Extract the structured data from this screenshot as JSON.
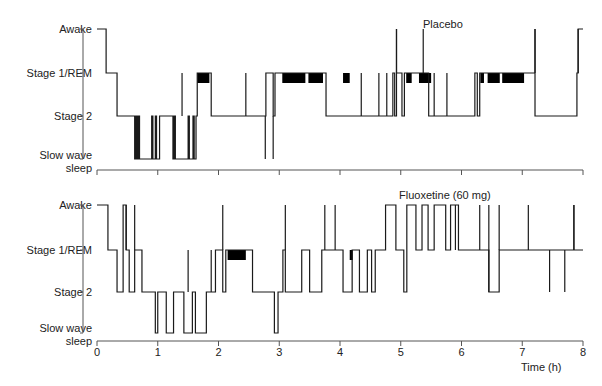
{
  "chart_data": [
    {
      "type": "line",
      "subtype": "hypnogram-step",
      "title": "Placebo",
      "xlabel": "Time (h)",
      "ylabel": "",
      "y_categories": [
        "Slow wave sleep",
        "Stage 2",
        "Stage 1/REM",
        "Awake"
      ],
      "xlim": [
        0,
        8
      ],
      "grid": false,
      "steps": [
        [
          0.0,
          3
        ],
        [
          0.15,
          2
        ],
        [
          0.33,
          1
        ],
        [
          0.62,
          0
        ],
        [
          0.64,
          1
        ],
        [
          0.66,
          0
        ],
        [
          0.68,
          1
        ],
        [
          0.7,
          0
        ],
        [
          0.9,
          1
        ],
        [
          0.92,
          0
        ],
        [
          0.96,
          1
        ],
        [
          0.98,
          0
        ],
        [
          1.03,
          1
        ],
        [
          1.23,
          1
        ],
        [
          1.25,
          0
        ],
        [
          1.27,
          1
        ],
        [
          1.29,
          0
        ],
        [
          1.5,
          1
        ],
        [
          1.52,
          0
        ],
        [
          1.58,
          1
        ],
        [
          1.6,
          0
        ],
        [
          1.63,
          1
        ],
        [
          1.65,
          2
        ],
        [
          1.88,
          1
        ],
        [
          2.77,
          0
        ],
        [
          2.77,
          1
        ],
        [
          2.78,
          2
        ],
        [
          2.9,
          1
        ],
        [
          2.93,
          2
        ],
        [
          3.77,
          1
        ],
        [
          4.87,
          2
        ],
        [
          4.9,
          1
        ],
        [
          4.93,
          3
        ],
        [
          4.93,
          2
        ],
        [
          5.02,
          1
        ],
        [
          5.06,
          2
        ],
        [
          5.46,
          1
        ],
        [
          5.55,
          2
        ],
        [
          5.55,
          1
        ],
        [
          5.76,
          2
        ],
        [
          5.76,
          1
        ],
        [
          6.22,
          2
        ],
        [
          6.26,
          1
        ],
        [
          6.3,
          2
        ],
        [
          7.21,
          3
        ],
        [
          7.21,
          1
        ],
        [
          7.9,
          2
        ],
        [
          7.92,
          3
        ]
      ],
      "rem_blocks": [
        [
          1.65,
          1.85
        ],
        [
          3.05,
          3.43
        ],
        [
          3.48,
          3.72
        ],
        [
          4.05,
          4.16
        ],
        [
          5.09,
          5.18
        ],
        [
          5.3,
          5.5
        ],
        [
          6.31,
          6.37
        ],
        [
          6.43,
          6.63
        ],
        [
          6.67,
          7.03
        ]
      ],
      "spikes_to_awake": [
        4.93,
        5.37,
        7.21,
        7.92
      ],
      "spikes_to_stage1": [
        1.4,
        2.45,
        4.35,
        4.64,
        4.77
      ],
      "spikes_to_sws": [
        2.9
      ]
    },
    {
      "type": "line",
      "subtype": "hypnogram-step",
      "title": "Fluoxetine (60 mg)",
      "xlabel": "Time (h)",
      "ylabel": "",
      "y_categories": [
        "Slow wave sleep",
        "Stage 2",
        "Stage 1/REM",
        "Awake"
      ],
      "xlim": [
        0,
        8
      ],
      "grid": false,
      "steps": [
        [
          0.0,
          3
        ],
        [
          0.18,
          2
        ],
        [
          0.33,
          1
        ],
        [
          0.43,
          3
        ],
        [
          0.48,
          2
        ],
        [
          0.53,
          1
        ],
        [
          0.62,
          2
        ],
        [
          0.74,
          1
        ],
        [
          0.96,
          0
        ],
        [
          1.0,
          1
        ],
        [
          1.14,
          0
        ],
        [
          1.26,
          1
        ],
        [
          1.43,
          0
        ],
        [
          1.57,
          1
        ],
        [
          1.62,
          0
        ],
        [
          1.8,
          1
        ],
        [
          1.95,
          2
        ],
        [
          2.07,
          1
        ],
        [
          2.12,
          2
        ],
        [
          2.56,
          1
        ],
        [
          2.92,
          0
        ],
        [
          2.98,
          1
        ],
        [
          3.06,
          2
        ],
        [
          3.1,
          1
        ],
        [
          3.37,
          2
        ],
        [
          3.5,
          1
        ],
        [
          3.7,
          2
        ],
        [
          4.05,
          1
        ],
        [
          4.2,
          2
        ],
        [
          4.32,
          1
        ],
        [
          4.45,
          2
        ],
        [
          4.52,
          1
        ],
        [
          4.58,
          2
        ],
        [
          4.75,
          3
        ],
        [
          4.92,
          2
        ],
        [
          5.05,
          1
        ],
        [
          5.1,
          3
        ],
        [
          5.25,
          2
        ],
        [
          5.35,
          3
        ],
        [
          5.45,
          2
        ],
        [
          5.55,
          3
        ],
        [
          5.74,
          2
        ],
        [
          5.82,
          3
        ],
        [
          5.95,
          2
        ],
        [
          6.45,
          1
        ],
        [
          6.62,
          2
        ],
        [
          7.2,
          2
        ],
        [
          7.85,
          3
        ],
        [
          7.85,
          2
        ]
      ],
      "rem_blocks": [
        [
          2.15,
          2.45
        ],
        [
          4.16,
          4.21
        ]
      ],
      "spikes_to_awake": [
        0.48,
        0.62,
        2.07,
        3.1,
        3.75,
        3.92,
        5.9,
        6.3,
        6.45,
        6.62,
        7.1,
        7.85
      ],
      "spikes_to_stage1": [
        1.5,
        1.88
      ],
      "spikes_to_stage2": [
        6.45,
        7.45,
        7.7
      ]
    }
  ],
  "panels": {
    "top": {
      "title": "Placebo"
    },
    "bottom": {
      "title": "Fluoxetine (60 mg)"
    }
  },
  "y_labels": {
    "awake": "Awake",
    "stage1": "Stage 1/REM",
    "stage2": "Stage 2",
    "sws1": "Slow wave",
    "sws2": "sleep"
  },
  "x_ticks": [
    "0",
    "1",
    "2",
    "3",
    "4",
    "5",
    "6",
    "7",
    "8"
  ],
  "x_axis_label": "Time (h)",
  "colors": {
    "line": "#1a1a1a",
    "axis": "#555555",
    "rem": "#000000"
  }
}
